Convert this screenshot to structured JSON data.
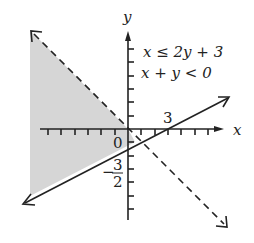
{
  "diagram": {
    "type": "graph-of-linear-inequalities",
    "axes": {
      "x_label": "x",
      "y_label": "y",
      "origin_label": "0",
      "x_tick_label": "3",
      "y_tick_label_num": "3",
      "y_tick_label_den": "2",
      "y_tick_label_sign": "−"
    },
    "inequalities": [
      {
        "text": "x ≤ 2y + 3",
        "boundary": "solid"
      },
      {
        "text": "x + y < 0",
        "boundary": "dashed"
      }
    ],
    "shading_color": "#d6d6d6",
    "line_color": "#222222"
  }
}
